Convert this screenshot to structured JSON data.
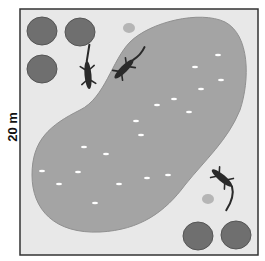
{
  "diagram": {
    "scale_label": "20 m",
    "colors": {
      "ground": "#e6e6e6",
      "pond": "#a2a2a2",
      "bush": "#6f6f6f",
      "animal": "#2a2a2a",
      "border": "#333333",
      "rock": "#b5b5b5"
    },
    "elements": {
      "bushes": 5,
      "lizards": 3,
      "rocks": 2,
      "pond": 1
    }
  }
}
